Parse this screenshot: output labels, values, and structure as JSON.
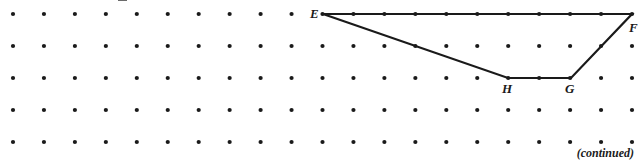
{
  "figure": {
    "name": "quadrilateral-efgh-on-dot-grid",
    "canvas": {
      "width": 640,
      "height": 164
    },
    "background_color": "#ffffff",
    "grid": {
      "columns": 21,
      "rows": 5,
      "origin_x": 13,
      "origin_y": 14,
      "spacing_x": 30.95,
      "spacing_y": 32,
      "dot_radius": 2.1,
      "dot_color": "#1a1a1a"
    },
    "shape": {
      "stroke_color": "#1a1a1a",
      "stroke_width": 2.2,
      "fill": "none",
      "closed": true,
      "vertices": [
        {
          "label": "E",
          "col": 10,
          "row": 0,
          "x": 323,
          "y": 14,
          "label_x": 310,
          "label_y": 7
        },
        {
          "label": "F",
          "col": 20,
          "row": 0,
          "x": 632,
          "y": 14,
          "label_x": 629,
          "label_y": 21
        },
        {
          "label": "G",
          "col": 18,
          "row": 2,
          "x": 571,
          "y": 78,
          "label_x": 565,
          "label_y": 82
        },
        {
          "label": "H",
          "col": 16,
          "row": 2,
          "x": 508,
          "y": 78,
          "label_x": 502,
          "label_y": 82
        }
      ],
      "edges": [
        {
          "name": "edge-EF",
          "from": "E",
          "to": "F"
        },
        {
          "name": "edge-FG",
          "from": "F",
          "to": "G"
        },
        {
          "name": "edge-GH",
          "from": "G",
          "to": "H"
        },
        {
          "name": "edge-HE",
          "from": "H",
          "to": "E"
        }
      ]
    }
  },
  "labels": {
    "vertex_e": "E",
    "vertex_f": "F",
    "vertex_g": "G",
    "vertex_h": "H"
  },
  "footer": {
    "continued_note": "(continued)"
  }
}
